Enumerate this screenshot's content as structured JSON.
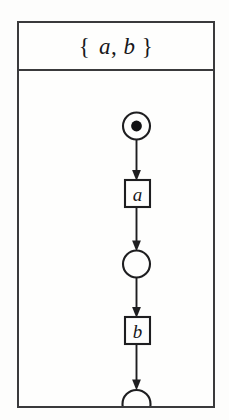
{
  "figure": {
    "kind": "petri-net",
    "header": {
      "title": "{ a, b }",
      "open_brace": "{",
      "first_symbol": "a",
      "separator": ",",
      "second_symbol": "b",
      "close_brace": "}"
    },
    "colors": {
      "page_background": "#fdfdfc",
      "panel_background": "#fefefd",
      "border": "#3a3a3c",
      "ink": "#1e1e20",
      "token_fill": "#121214"
    },
    "nodes": [
      {
        "id": "p0",
        "type": "place",
        "label": "",
        "tokens": 1,
        "cx": 117.5,
        "cy": 55,
        "r": 13.5
      },
      {
        "id": "t_a",
        "type": "transition",
        "label": "a",
        "x": 106,
        "y": 109,
        "width": 25,
        "height": 27
      },
      {
        "id": "p1",
        "type": "place",
        "label": "",
        "tokens": 0,
        "cx": 117.5,
        "cy": 193,
        "r": 13.5
      },
      {
        "id": "t_b",
        "type": "transition",
        "label": "b",
        "x": 106,
        "y": 246,
        "width": 25,
        "height": 27
      },
      {
        "id": "p2",
        "type": "place",
        "label": "",
        "tokens": 0,
        "cx": 117.5,
        "cy": 333,
        "r": 14
      }
    ],
    "arcs": [
      {
        "id": "arc-p0-ta",
        "from": "p0",
        "to": "t_a",
        "x": 117.5,
        "y1": 68.5,
        "y2": 109
      },
      {
        "id": "arc-ta-p1",
        "from": "t_a",
        "to": "p1",
        "x": 117.5,
        "y1": 136,
        "y2": 179.5
      },
      {
        "id": "arc-p1-tb",
        "from": "p1",
        "to": "t_b",
        "x": 117.5,
        "y1": 206.5,
        "y2": 246
      },
      {
        "id": "arc-tb-p2",
        "from": "t_b",
        "to": "p2",
        "x": 117.5,
        "y1": 273,
        "y2": 319
      }
    ]
  }
}
